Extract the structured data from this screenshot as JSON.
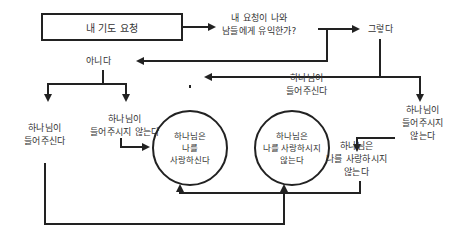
{
  "diagram": {
    "start": "내 기도 요청",
    "question": [
      "내 요청이 나와",
      "남들에게 유익한가?"
    ],
    "yes": "그렇다",
    "no": "아니다",
    "no_gives": [
      "하나님이",
      "들어주신다"
    ],
    "no_not_gives": [
      "하나님이",
      "들어주시지 않는다"
    ],
    "yes_gives": [
      "하나님이",
      "들어주신다"
    ],
    "yes_not_gives": [
      "하나님이",
      "들어주시지",
      "않는다"
    ],
    "loves_circle": [
      "하나님은",
      "나를",
      "사랑하신다"
    ],
    "not_loves_circle": [
      "하나님은",
      "나를 사랑하시지",
      "않는다"
    ],
    "not_loves_text": [
      "하나님은",
      "나를 사랑하시지",
      "않는다"
    ]
  },
  "colors": {
    "line": "#222222",
    "text": "#333333",
    "background": "#ffffff"
  }
}
